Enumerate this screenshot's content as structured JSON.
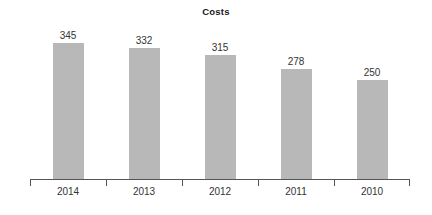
{
  "chart_data": {
    "type": "bar",
    "title": "Costs",
    "categories": [
      "2014",
      "2013",
      "2012",
      "2011",
      "2010"
    ],
    "values": [
      345,
      332,
      315,
      278,
      250
    ],
    "xlabel": "",
    "ylabel": "",
    "ylim": [
      0,
      450
    ],
    "grid": false,
    "legend": null,
    "bar_color": "#b8b8b8",
    "axis_color": "#555555",
    "text_color": "#333333",
    "title_color": "#1a1a1a",
    "background": "#ffffff"
  }
}
